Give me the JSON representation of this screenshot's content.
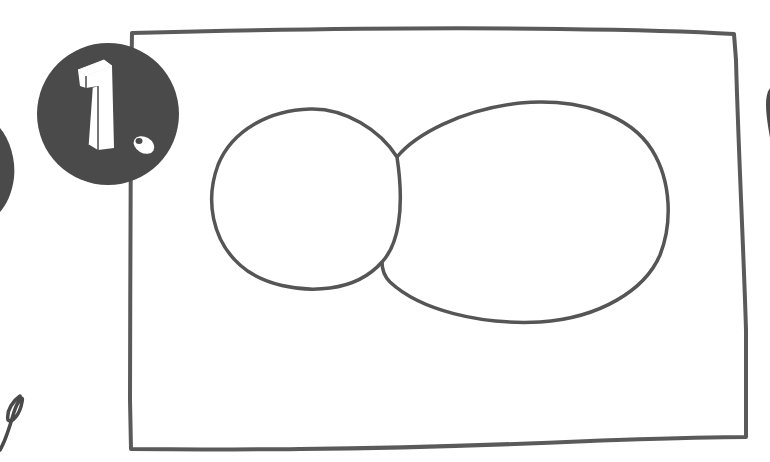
{
  "illustration": {
    "step_badge": {
      "label": "1.",
      "fill_color": "#4a4a4a",
      "glyph_color": "#ffffff"
    },
    "frame": {
      "stroke_color": "#5a5a5a"
    },
    "shapes": [
      {
        "kind": "circle",
        "label": "small circle"
      },
      {
        "kind": "oval",
        "label": "large oval"
      }
    ],
    "stroke_color": "#555555",
    "background_color": "#ffffff"
  }
}
